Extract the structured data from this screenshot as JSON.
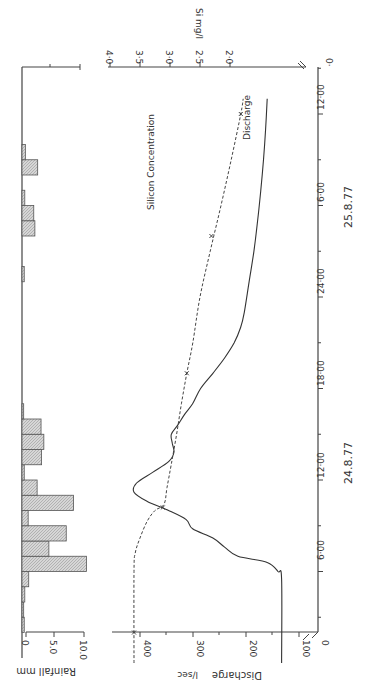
{
  "chart_data": [
    {
      "type": "bar",
      "title": "Rainfall",
      "ylabel": "Rainfall mm",
      "xlabel": "Time",
      "yticks": [
        "0",
        "5.0",
        "10.0"
      ],
      "ylim": [
        0,
        12
      ],
      "orientation": "rotated 90° clockwise (time runs bottom-to-top)",
      "bin_hours": 1,
      "bars": [
        {
          "start_h": 2,
          "value": 0.4
        },
        {
          "start_h": 3,
          "value": 0.3
        },
        {
          "start_h": 4,
          "value": 0.5
        },
        {
          "start_h": 5,
          "value": 1.2
        },
        {
          "start_h": 6,
          "value": 11.5
        },
        {
          "start_h": 7,
          "value": 4.8
        },
        {
          "start_h": 8,
          "value": 7.9
        },
        {
          "start_h": 9,
          "value": 1.1
        },
        {
          "start_h": 10,
          "value": 9.2
        },
        {
          "start_h": 11,
          "value": 2.7
        },
        {
          "start_h": 12,
          "value": 0.4
        },
        {
          "start_h": 13,
          "value": 3.5
        },
        {
          "start_h": 14,
          "value": 3.9
        },
        {
          "start_h": 15,
          "value": 3.4
        },
        {
          "start_h": 16,
          "value": 0.3
        },
        {
          "start_h": 25,
          "value": 0.4
        },
        {
          "start_h": 28,
          "value": 2.3
        },
        {
          "start_h": 29,
          "value": 2.1
        },
        {
          "start_h": 30,
          "value": 0.5
        },
        {
          "start_h": 32,
          "value": 2.8
        },
        {
          "start_h": 33,
          "value": 0.6
        }
      ]
    },
    {
      "type": "line",
      "title": "Discharge and Silicon Concentration",
      "xlabel": "Time",
      "x_ticks": [
        "6·00",
        "12·00",
        "18·00",
        "24·00",
        "6·00",
        "12·00"
      ],
      "x_tick_hours": [
        6,
        12,
        18,
        24,
        30,
        36
      ],
      "date_labels": [
        {
          "label": "24.8.77",
          "hour": 13
        },
        {
          "label": "25.8.77",
          "hour": 31
        }
      ],
      "series": [
        {
          "name": "Discharge",
          "axis": "Discharge l/sec",
          "axis_ticks": [
            "0",
            "100",
            "200",
            "300",
            "400"
          ],
          "ylim": [
            0,
            450
          ],
          "style": "solid",
          "points": [
            [
              0,
              133
            ],
            [
              5.5,
              133
            ],
            [
              6,
              140
            ],
            [
              6.6,
              160
            ],
            [
              7,
              215
            ],
            [
              7.6,
              240
            ],
            [
              8.2,
              262
            ],
            [
              8.8,
              300
            ],
            [
              9.4,
              312
            ],
            [
              10,
              345
            ],
            [
              10.6,
              385
            ],
            [
              11.2,
              410
            ],
            [
              11.8,
              405
            ],
            [
              12.5,
              375
            ],
            [
              13.2,
              345
            ],
            [
              13.8,
              335
            ],
            [
              14.4,
              338
            ],
            [
              15,
              340
            ],
            [
              15.6,
              328
            ],
            [
              16.3,
              315
            ],
            [
              17,
              300
            ],
            [
              18,
              285
            ],
            [
              19,
              262
            ],
            [
              20,
              240
            ],
            [
              21,
              222
            ],
            [
              22,
              210
            ],
            [
              23,
              203
            ],
            [
              25,
              194
            ],
            [
              27,
              185
            ],
            [
              29,
              178
            ],
            [
              31,
              172
            ],
            [
              33,
              167
            ],
            [
              35,
              163
            ],
            [
              37,
              160
            ]
          ]
        },
        {
          "name": "Silicon Concentration",
          "axis": "Si mg/l",
          "axis_ticks": [
            "2·0",
            "2·5",
            "3·0",
            "3·5",
            "4·0"
          ],
          "ylim": [
            1.5,
            4.0
          ],
          "style": "dashed",
          "points": [
            [
              0,
              3.6
            ],
            [
              6,
              3.6
            ],
            [
              7.2,
              3.58
            ],
            [
              8.2,
              3.5
            ],
            [
              9.3,
              3.38
            ],
            [
              10,
              3.25
            ],
            [
              10.4,
              3.1
            ],
            [
              11.5,
              3.05
            ],
            [
              13,
              2.98
            ],
            [
              15,
              2.89
            ],
            [
              17,
              2.81
            ],
            [
              19,
              2.72
            ],
            [
              21,
              2.62
            ],
            [
              24,
              2.5
            ],
            [
              27,
              2.33
            ],
            [
              30,
              2.15
            ],
            [
              33,
              1.98
            ],
            [
              36,
              1.82
            ],
            [
              37,
              1.78
            ]
          ],
          "markers": [
            [
              2,
              3.6
            ],
            [
              10.2,
              3.12
            ],
            [
              19,
              2.72
            ],
            [
              28,
              2.31
            ],
            [
              36,
              1.82
            ]
          ]
        }
      ],
      "annotations": [
        "Silicon Concentration",
        "Discharge"
      ]
    }
  ],
  "labels": {
    "rainfall_axis": "Rainfall mm",
    "rain_tick_0": "0",
    "rain_tick_5": "5.0",
    "rain_tick_10": "10.0",
    "discharge_axis": "Discharge",
    "discharge_unit": "l/sec",
    "q_0": "0",
    "q_100": "100",
    "q_200": "200",
    "q_300": "300",
    "q_400": "400",
    "si_axis": "Si mg/l",
    "si_20": "2·0",
    "si_25": "2·5",
    "si_30": "3·0",
    "si_35": "3·5",
    "si_40": "4·0",
    "si_0": "0·",
    "silicon_label": "Silicon Concentration",
    "discharge_label": "Discharge",
    "t_6a": "6·00",
    "t_12a": "12·00",
    "t_18a": "18·00",
    "t_24": "24·00",
    "t_6b": "6·00",
    "t_12b": "12·00",
    "date1": "24.8.77",
    "date2": "25.8.77"
  }
}
